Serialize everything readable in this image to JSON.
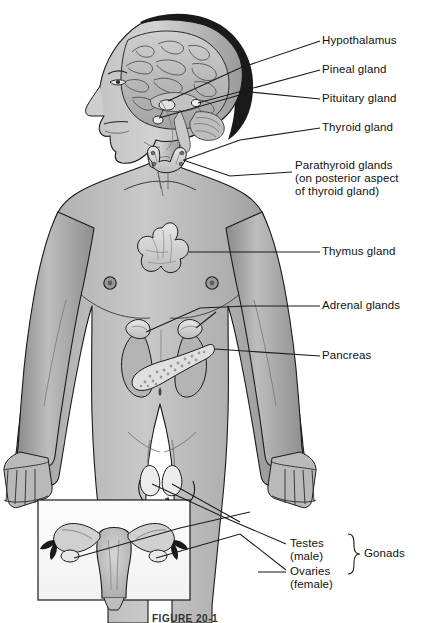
{
  "figure": {
    "caption": "FIGURE 20-1",
    "background_color": "#ffffff",
    "line_color": "#1a1a1a",
    "body_fill": "#b0b0b0",
    "organ_fill": "#d8d8d8"
  },
  "labels": {
    "hypothalamus": "Hypothalamus",
    "pineal_gland": "Pineal gland",
    "pituitary_gland": "Pituitary gland",
    "thyroid_gland": "Thyroid gland",
    "parathyroid_line1": "Parathyroid glands",
    "parathyroid_line2": "(on posterior aspect",
    "parathyroid_line3": "of thyroid gland)",
    "thymus_gland": "Thymus gland",
    "adrenal_glands": "Adrenal glands",
    "pancreas": "Pancreas",
    "testes_line1": "Testes",
    "testes_line2": "(male)",
    "ovaries_line1": "Ovaries",
    "ovaries_line2": "(female)",
    "gonads": "Gonads"
  },
  "structures": [
    {
      "name": "brain",
      "region": "head"
    },
    {
      "name": "hypothalamus",
      "region": "head"
    },
    {
      "name": "pineal-gland",
      "region": "head"
    },
    {
      "name": "pituitary-gland",
      "region": "head"
    },
    {
      "name": "thyroid-gland",
      "region": "neck"
    },
    {
      "name": "parathyroid-glands",
      "region": "neck"
    },
    {
      "name": "thymus-gland",
      "region": "chest"
    },
    {
      "name": "adrenal-glands",
      "region": "abdomen"
    },
    {
      "name": "pancreas",
      "region": "abdomen"
    },
    {
      "name": "testes",
      "region": "pelvis"
    },
    {
      "name": "ovaries",
      "region": "inset"
    }
  ]
}
